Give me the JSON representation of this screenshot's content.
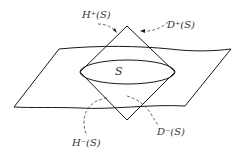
{
  "diagram": {
    "type": "spacetime-domain-of-dependence",
    "labels": {
      "surface": "S",
      "future_horizon": "H⁺(S)",
      "future_domain": "D⁺(S)",
      "past_horizon": "H⁻(S)",
      "past_domain": "D⁻(S)"
    },
    "colors": {
      "stroke": "#1a1a1a",
      "dashed": "#444444",
      "text": "#333333",
      "background": "#ffffff"
    }
  }
}
